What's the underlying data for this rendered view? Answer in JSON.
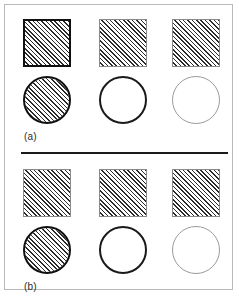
{
  "figure": {
    "background_color": "#ffffff",
    "frame_color": "#b9b9b9",
    "divider_color": "#1a1a1a",
    "hatch_color": "#2b2b2b",
    "heavy_edge_color": "#101010",
    "light_edge_color": "#8a8a8a",
    "panels": [
      {
        "caption": "(a)",
        "rows": [
          {
            "shape": "square",
            "items": [
              {
                "name": "square-hatched-heavy-edge",
                "fill": "hatched",
                "edge": "heavy"
              },
              {
                "name": "square-hatched-light-edge",
                "fill": "hatched",
                "edge": "light"
              },
              {
                "name": "square-hatched-light-edge",
                "fill": "hatched",
                "edge": "light"
              }
            ]
          },
          {
            "shape": "circle",
            "items": [
              {
                "name": "circle-hatched-heavy-edge",
                "fill": "hatched",
                "edge": "heavy"
              },
              {
                "name": "circle-plain-heavy-edge",
                "fill": "plain",
                "edge": "medium"
              },
              {
                "name": "circle-plain-faint-edge",
                "fill": "plain",
                "edge": "faint"
              }
            ]
          }
        ]
      },
      {
        "caption": "(b)",
        "rows": [
          {
            "shape": "square",
            "items": [
              {
                "name": "square-hatched-light-edge",
                "fill": "hatched",
                "edge": "light"
              },
              {
                "name": "square-hatched-light-edge",
                "fill": "hatched",
                "edge": "light"
              },
              {
                "name": "square-hatched-light-edge",
                "fill": "hatched",
                "edge": "light"
              }
            ]
          },
          {
            "shape": "circle",
            "items": [
              {
                "name": "circle-hatched-heavy-edge",
                "fill": "hatched",
                "edge": "heavy"
              },
              {
                "name": "circle-plain-heavy-edge",
                "fill": "plain",
                "edge": "medium"
              },
              {
                "name": "circle-plain-faint-edge",
                "fill": "plain",
                "edge": "faint"
              }
            ]
          }
        ]
      }
    ]
  }
}
